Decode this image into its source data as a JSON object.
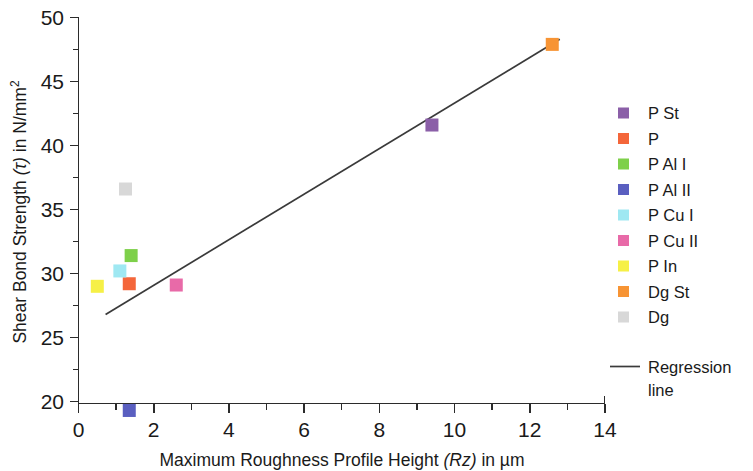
{
  "chart_data": {
    "type": "scatter",
    "title": "",
    "xlabel": "Maximum Roughness Profile Height (Rz) in µm",
    "xlabel_parts": {
      "pre": "Maximum Roughness Profile Height ",
      "italic": "(Rz)",
      "post": " in µm"
    },
    "ylabel": "Shear Bond Strength (τ) in N/mm²",
    "ylabel_parts": {
      "pre": "Shear Bond Strength ",
      "italic": "(τ)",
      "post": " in N/mm",
      "sup": "2"
    },
    "xlim": [
      0,
      14
    ],
    "ylim": [
      18.2,
      50
    ],
    "x_ticks": [
      0,
      2,
      4,
      6,
      8,
      10,
      12,
      14
    ],
    "x_tick_labels": [
      "0",
      "2",
      "4",
      "6",
      "8",
      "10",
      "12",
      "14"
    ],
    "x_minor_step": 1,
    "y_ticks": [
      20,
      25,
      30,
      35,
      40,
      45,
      50
    ],
    "y_tick_labels": [
      "20",
      "25",
      "30",
      "35",
      "40",
      "45",
      "50"
    ],
    "y_minor_step": 2.5,
    "grid": false,
    "legend_position": "right",
    "marker_shape": "square",
    "points": [
      {
        "name": "P St",
        "x": 9.4,
        "y": 41.6,
        "color": "#8b5fa8"
      },
      {
        "name": "P",
        "x": 1.35,
        "y": 29.2,
        "color": "#f4663a"
      },
      {
        "name": "P Al I",
        "x": 1.4,
        "y": 31.4,
        "color": "#7ed04a"
      },
      {
        "name": "P Al II",
        "x": 1.35,
        "y": 19.3,
        "color": "#5a5fc0"
      },
      {
        "name": "P Cu I",
        "x": 1.1,
        "y": 30.2,
        "color": "#9fe8f2"
      },
      {
        "name": "P Cu II",
        "x": 2.6,
        "y": 29.1,
        "color": "#e86aa8"
      },
      {
        "name": "P In",
        "x": 0.5,
        "y": 29.0,
        "color": "#f6f046"
      },
      {
        "name": "Dg St",
        "x": 12.6,
        "y": 47.9,
        "color": "#f79434"
      },
      {
        "name": "Dg",
        "x": 1.25,
        "y": 36.6,
        "color": "#d8d8d8"
      }
    ],
    "regression": {
      "label_line1": "Regression",
      "label_line2": "line",
      "x_start": 0.72,
      "y_start": 26.8,
      "x_end": 12.8,
      "y_end": 48.3,
      "color": "#3a3a3a"
    }
  },
  "legend": {
    "items": [
      {
        "label": "P St",
        "color": "#8b5fa8"
      },
      {
        "label": "P",
        "color": "#f4663a"
      },
      {
        "label": "P Al I",
        "color": "#7ed04a"
      },
      {
        "label": "P Al II",
        "color": "#5a5fc0"
      },
      {
        "label": "P Cu I",
        "color": "#9fe8f2"
      },
      {
        "label": "P Cu II",
        "color": "#e86aa8"
      },
      {
        "label": "P In",
        "color": "#f6f046"
      },
      {
        "label": "Dg St",
        "color": "#f79434"
      },
      {
        "label": "Dg",
        "color": "#d8d8d8"
      }
    ],
    "regression_label_line1": "Regression",
    "regression_label_line2": "line"
  },
  "axes": {
    "x_tick_0": "0",
    "x_tick_1": "2",
    "x_tick_2": "4",
    "x_tick_3": "6",
    "x_tick_4": "8",
    "x_tick_5": "10",
    "x_tick_6": "12",
    "x_tick_7": "14",
    "y_tick_0": "20",
    "y_tick_1": "25",
    "y_tick_2": "30",
    "y_tick_3": "35",
    "y_tick_4": "40",
    "y_tick_5": "45",
    "y_tick_6": "50",
    "x_title_pre": "Maximum Roughness Profile Height ",
    "x_title_italic": "(Rz)",
    "x_title_post": " in µm",
    "y_title_pre": "Shear Bond Strength ",
    "y_title_italic": "(τ)",
    "y_title_post": " in N/mm",
    "y_title_sup": "2"
  }
}
